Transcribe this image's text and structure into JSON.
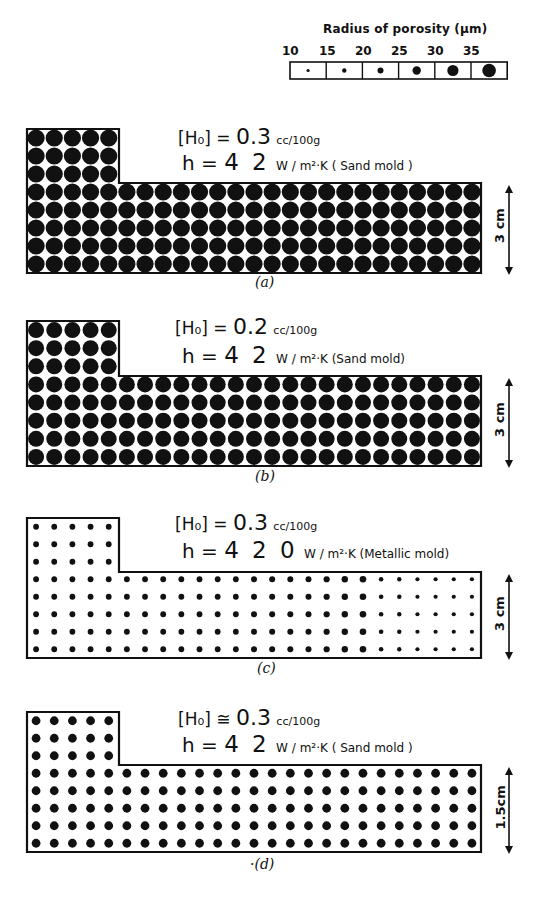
{
  "legend": {
    "title": "Radius of porosity (µm)",
    "ticks": [
      "10",
      "15",
      "20",
      "25",
      "30",
      "35"
    ],
    "cell_dot_radii": [
      1.6,
      2.2,
      3.0,
      4.2,
      5.6,
      6.8
    ]
  },
  "panels": [
    {
      "id": "a",
      "caption": "(a)",
      "h0_label": "[H₀] = ",
      "h0_value": "0.3",
      "h0_unit": "cc/100g",
      "h_label": "h = ",
      "h_value": "4 2",
      "h_unit": "W / m²·K ( Sand mold )",
      "dimension": "3 cm",
      "top": 129,
      "step": 183,
      "bottom": 273,
      "dot_radius": 8.6,
      "right_profile": null
    },
    {
      "id": "b",
      "caption": "(b)",
      "h0_label": "[H₀] = ",
      "h0_value": "0.2",
      "h0_unit": "cc/100g",
      "h_label": "h = ",
      "h_value": "4 2",
      "h_unit": "W / m²·K (Sand mold)",
      "dimension": "3 cm",
      "top": 321,
      "step": 376,
      "bottom": 466,
      "dot_radius": 8.0,
      "right_profile": null
    },
    {
      "id": "c",
      "caption": "(c)",
      "h0_label": "[H₀] = ",
      "h0_value": "0.3",
      "h0_unit": "cc/100g",
      "h_label": "h = ",
      "h_value": "4 2 0",
      "h_unit": "W / m²·K (Metallic mold)",
      "dimension": "3 cm",
      "top": 518,
      "step": 572,
      "bottom": 658,
      "dot_radius": 2.9,
      "right_profile": [
        2.9,
        2.9,
        2.9,
        2.9,
        2.9,
        2.9,
        2.9,
        2.9,
        2.9,
        2.9,
        2.9,
        2.9,
        3.0,
        3.0,
        3.0,
        3.0,
        3.1,
        3.2,
        3.3,
        2.3,
        2.2,
        2.1,
        2.1,
        2.1,
        2.1
      ]
    },
    {
      "id": "d",
      "caption": "·(d)",
      "h0_label": "[H₀] ≅ ",
      "h0_value": "0.3",
      "h0_unit": "cc/100g",
      "h_label": "h = ",
      "h_value": "4 2",
      "h_unit": "W / m²·K ( Sand mold )",
      "dimension": "1.5cm",
      "top": 712,
      "step": 765,
      "bottom": 852,
      "dot_radius": 4.4,
      "right_profile": null
    }
  ],
  "geometry": {
    "left": 27,
    "tall_right": 119,
    "right": 481,
    "cols": 25,
    "rows": 8,
    "tall_rows": 3,
    "tall_cols": 5
  },
  "colors": {
    "ink": "#111111",
    "paper": "#ffffff"
  }
}
